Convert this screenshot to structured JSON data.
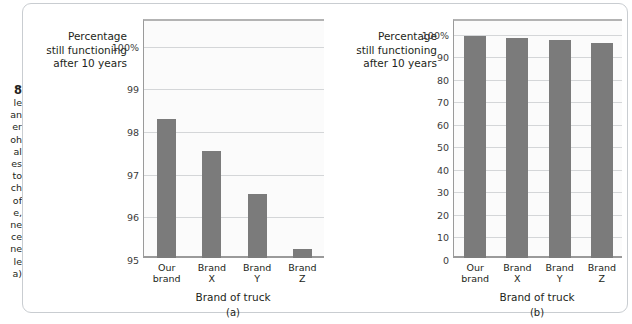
{
  "caption_strip": {
    "figure_number": "8",
    "visible_line_fragments": [
      "le",
      "an",
      "er",
      "oh",
      "al",
      "es",
      "to",
      "ch",
      "of",
      "e,",
      "ne",
      "ce",
      "ne",
      "le",
      "a)"
    ]
  },
  "charts": [
    {
      "panel_label": "(a)",
      "y_axis_title_lines": [
        "Percentage",
        "still functioning",
        "after 10 years"
      ],
      "x_axis_title": "Brand of truck"
    },
    {
      "panel_label": "(b)",
      "y_axis_title_lines": [
        "Percentage",
        "still functioning",
        "after 10 years"
      ],
      "x_axis_title": "Brand of truck"
    }
  ],
  "colors": {
    "bar": "#7b7b7b",
    "plot_background": "#fbfbfb",
    "gridline": "#d4d6d8",
    "axis": "#9a9a9a",
    "panel_border": "#c9cdd1",
    "text": "#231f20"
  },
  "chart_data": [
    {
      "type": "bar",
      "title": "(a)",
      "categories": [
        "Our brand",
        "Brand X",
        "Brand Y",
        "Brand Z"
      ],
      "category_lines": [
        [
          "Our",
          "brand"
        ],
        [
          "Brand",
          "X"
        ],
        [
          "Brand",
          "Y"
        ],
        [
          "Brand",
          "Z"
        ]
      ],
      "values": [
        98.25,
        97.5,
        96.5,
        95.2
      ],
      "xlabel": "Brand of truck",
      "ylabel": "Percentage still functioning after 10 years",
      "ylim": [
        95,
        100.6
      ],
      "yticks": [
        95,
        96,
        97,
        98,
        99,
        100
      ],
      "ytick_labels": [
        "95",
        "96",
        "97",
        "98",
        "99",
        "100%"
      ],
      "grid": true,
      "legend": false,
      "note": "truncated y-axis starting at 95"
    },
    {
      "type": "bar",
      "title": "(b)",
      "categories": [
        "Our brand",
        "Brand X",
        "Brand Y",
        "Brand Z"
      ],
      "category_lines": [
        [
          "Our",
          "brand"
        ],
        [
          "Brand",
          "X"
        ],
        [
          "Brand",
          "Y"
        ],
        [
          "Brand",
          "Z"
        ]
      ],
      "values": [
        98.25,
        97.5,
        96.5,
        95.2
      ],
      "xlabel": "Brand of truck",
      "ylabel": "Percentage still functioning after 10 years",
      "ylim": [
        0,
        106
      ],
      "yticks": [
        0,
        10,
        20,
        30,
        40,
        50,
        60,
        70,
        80,
        90,
        100
      ],
      "ytick_labels": [
        "0",
        "10",
        "20",
        "30",
        "40",
        "50",
        "60",
        "70",
        "80",
        "90",
        "100%"
      ],
      "grid": true,
      "legend": false,
      "note": "full y-axis starting at 0"
    }
  ]
}
